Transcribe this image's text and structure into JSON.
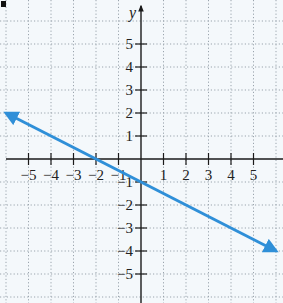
{
  "chart_data": {
    "type": "line",
    "title": "",
    "xlabel": "",
    "ylabel": "y",
    "xlim": [
      -6,
      6
    ],
    "ylim": [
      -6,
      6
    ],
    "grid": true,
    "grid_style": "dotted",
    "x_ticks": [
      -5,
      -4,
      -3,
      -2,
      -1,
      1,
      2,
      3,
      4,
      5
    ],
    "y_ticks": [
      -5,
      -4,
      -3,
      -2,
      -1,
      1,
      2,
      3,
      4,
      5
    ],
    "x_tick_labels": [
      "−5",
      "−4",
      "−3",
      "−2",
      "−1",
      "1",
      "2",
      "3",
      "4",
      "5"
    ],
    "y_tick_labels": [
      "−5",
      "−4",
      "−3",
      "−2",
      "−1",
      "1",
      "2",
      "3",
      "4",
      "5"
    ],
    "series": [
      {
        "name": "line",
        "equation": "y = -x/2 - 1",
        "slope": -0.5,
        "intercept": -1,
        "x": [
          -6,
          -2,
          0,
          6
        ],
        "y": [
          2,
          0,
          -1,
          -4
        ],
        "arrows": "both",
        "color": "#2f8fd8"
      }
    ]
  },
  "colors": {
    "background": "#f4f8fb",
    "grid": "#9aa4ad",
    "axis": "#1a1a1a",
    "line": "#2f8fd8"
  }
}
